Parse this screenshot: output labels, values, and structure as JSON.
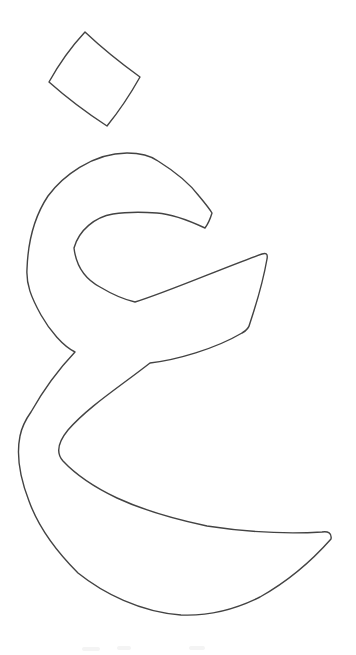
{
  "page": {
    "background_color": "#ffffff",
    "width": 356,
    "height": 655
  },
  "figure": {
    "name": "Outline drawing of the isolated Arabic letter ghayn",
    "glyph_character": "غ",
    "style": "unfilled outline / coloring-page style line art",
    "stroke_color": "#434343",
    "stroke_width": "1.4",
    "viewbox": "0 0 356 655",
    "dot_path": "M 85 32 C 103 49 122 64 140 77 C 131 93 120 110 107 126 C 87 113 67 98 49 82 C 59 64 71 47 85 32 Z",
    "body_path": "M 212 213 C 210.5 218 208 224 205 228 C 190 221 172 214 157 213 C 142 212 126 212 113 214 C 95 217 79 230 74 248 C 76 265 85 279 100 287 C 110 293 122 299 135 302 C 170 291 225 267 262 254 C 266 252.5 268 254 267 259 C 263 282 256 305 250 323 C 249 328 246 331 242 333 C 215 349 176 360 150 363 C 118 388 88 407 68 430 C 59 441 55 452 63 461 C 78 477 98 489 117 498 C 143 510 174 519 207 526 C 246 532 290 534 322 532 C 328 531 332 533 331 539 C 316 556 292 579 260 597 C 232 611 204 616 181 615 C 140 612 103 593 78 573 C 56 551 38 526 29 501 C 20 478 16 456 20 436 C 22 426 26 419 31 412 C 40 396 56 372 75 352 C 63 346 50 331 41 315 C 31 297 26 284 27 269 C 28 240 36 214 48 196 C 62 177 92 153 127 153 C 141 153 151 156 158 161 C 174 171 190 184 199 196 C 204 202 209 208 212 213 Z",
    "bottom_edge_artifact_path": "M 84 649 h 14 M 119 648 h 10 M 191 648 h 12",
    "artifact_color": "#f4f4f4",
    "artifact_stroke_width": "4"
  }
}
